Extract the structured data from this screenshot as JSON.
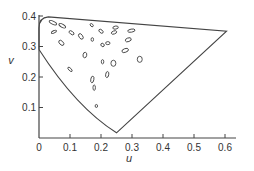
{
  "chart_data": {
    "type": "scatter",
    "title": "",
    "xlabel": "u",
    "ylabel": "v",
    "xlim": [
      0,
      0.65
    ],
    "ylim": [
      0,
      0.4
    ],
    "grid": false,
    "legend": null,
    "x_ticks": [
      "0",
      "0.1",
      "0.2",
      "0.3",
      "0.4",
      "0.5",
      "0.6"
    ],
    "y_ticks": [
      "0.1",
      "0.2",
      "0.3",
      "0.4"
    ],
    "boundary": {
      "description": "Spectrum locus / gamut outline in u,v chromaticity space",
      "points": [
        [
          0.0,
          0.29
        ],
        [
          0.04,
          0.22
        ],
        [
          0.1,
          0.14
        ],
        [
          0.18,
          0.07
        ],
        [
          0.25,
          0.017
        ],
        [
          0.4,
          0.14
        ],
        [
          0.605,
          0.35
        ],
        [
          0.03,
          0.397
        ],
        [
          0.01,
          0.39
        ],
        [
          0.0,
          0.37
        ],
        [
          0.0,
          0.29
        ]
      ]
    },
    "ellipses": [
      {
        "u": 0.045,
        "v": 0.378,
        "rx": 0.013,
        "ry": 0.005,
        "angle": 25
      },
      {
        "u": 0.075,
        "v": 0.368,
        "rx": 0.012,
        "ry": 0.005,
        "angle": 30
      },
      {
        "u": 0.048,
        "v": 0.348,
        "rx": 0.009,
        "ry": 0.004,
        "angle": -25
      },
      {
        "u": 0.072,
        "v": 0.312,
        "rx": 0.01,
        "ry": 0.006,
        "angle": 45
      },
      {
        "u": 0.105,
        "v": 0.345,
        "rx": 0.009,
        "ry": 0.005,
        "angle": 35
      },
      {
        "u": 0.135,
        "v": 0.333,
        "rx": 0.01,
        "ry": 0.006,
        "angle": 55
      },
      {
        "u": 0.17,
        "v": 0.37,
        "rx": 0.006,
        "ry": 0.004,
        "angle": 45
      },
      {
        "u": 0.2,
        "v": 0.35,
        "rx": 0.008,
        "ry": 0.005,
        "angle": 40
      },
      {
        "u": 0.172,
        "v": 0.323,
        "rx": 0.004,
        "ry": 0.006,
        "angle": 0
      },
      {
        "u": 0.205,
        "v": 0.305,
        "rx": 0.006,
        "ry": 0.005,
        "angle": 40
      },
      {
        "u": 0.247,
        "v": 0.362,
        "rx": 0.009,
        "ry": 0.005,
        "angle": -10
      },
      {
        "u": 0.242,
        "v": 0.346,
        "rx": 0.009,
        "ry": 0.005,
        "angle": -20
      },
      {
        "u": 0.222,
        "v": 0.311,
        "rx": 0.007,
        "ry": 0.005,
        "angle": 0
      },
      {
        "u": 0.298,
        "v": 0.352,
        "rx": 0.012,
        "ry": 0.005,
        "angle": -10
      },
      {
        "u": 0.288,
        "v": 0.322,
        "rx": 0.01,
        "ry": 0.006,
        "angle": -20
      },
      {
        "u": 0.278,
        "v": 0.287,
        "rx": 0.011,
        "ry": 0.006,
        "angle": -20
      },
      {
        "u": 0.24,
        "v": 0.245,
        "rx": 0.008,
        "ry": 0.01,
        "angle": 0
      },
      {
        "u": 0.148,
        "v": 0.272,
        "rx": 0.006,
        "ry": 0.009,
        "angle": 10
      },
      {
        "u": 0.205,
        "v": 0.25,
        "rx": 0.004,
        "ry": 0.007,
        "angle": 0
      },
      {
        "u": 0.1,
        "v": 0.225,
        "rx": 0.009,
        "ry": 0.004,
        "angle": 45
      },
      {
        "u": 0.22,
        "v": 0.208,
        "rx": 0.005,
        "ry": 0.01,
        "angle": 10
      },
      {
        "u": 0.172,
        "v": 0.192,
        "rx": 0.005,
        "ry": 0.011,
        "angle": 10
      },
      {
        "u": 0.185,
        "v": 0.105,
        "rx": 0.002,
        "ry": 0.005,
        "angle": 0
      },
      {
        "u": 0.325,
        "v": 0.258,
        "rx": 0.008,
        "ry": 0.01,
        "angle": 0
      },
      {
        "u": 0.178,
        "v": 0.165,
        "rx": 0.004,
        "ry": 0.009,
        "angle": 0
      }
    ]
  }
}
